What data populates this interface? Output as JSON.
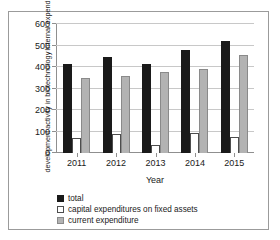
{
  "chart_data": {
    "type": "bar",
    "title": "",
    "categories": [
      "2011",
      "2012",
      "2013",
      "2014",
      "2015"
    ],
    "series": [
      {
        "name": "total",
        "color": "#1a1a1a",
        "values": [
          415,
          447,
          412,
          478,
          523
        ]
      },
      {
        "name": "capital expenditures on fixed assets",
        "color": "#ffffff",
        "values": [
          68,
          88,
          35,
          92,
          74
        ]
      },
      {
        "name": "current expenditure",
        "color": "#b3b3b3",
        "values": [
          348,
          358,
          378,
          391,
          456
        ]
      }
    ],
    "xlabel": "Year",
    "ylabel": "Internal expenditure on research and development activity in biotechnology",
    "ylabel_line1": "Internal expenditure on research and",
    "ylabel_line2": "development activity in biotechnology",
    "ylim": [
      0,
      600
    ],
    "ytick_values": [
      0,
      100,
      200,
      300,
      400,
      500,
      600
    ],
    "ytick_labels": [
      "0",
      "100",
      "200",
      "300",
      "400",
      "500",
      "600"
    ],
    "grid": true,
    "legend_position": "bottom-left"
  }
}
